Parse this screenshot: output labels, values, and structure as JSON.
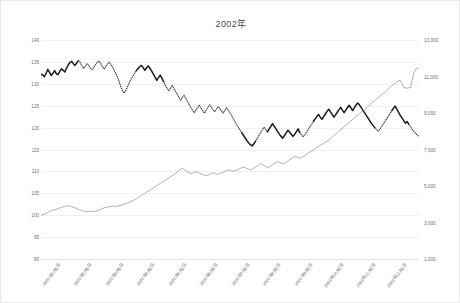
{
  "chart_data": {
    "type": "line",
    "title": "2002年",
    "xlabel": "",
    "ylabel": "",
    "grid": true,
    "legend": "none",
    "left_axis": {
      "ticks": [
        "140",
        "135",
        "130",
        "125",
        "120",
        "115",
        "110",
        "105",
        "100",
        "95",
        "90"
      ],
      "min": 90,
      "max": 140,
      "step": 5
    },
    "right_axis": {
      "ticks": [
        "13,000",
        "11,000",
        "9,000",
        "7,000",
        "5,000",
        "3,000",
        "1,000"
      ],
      "min": 1000,
      "max": 13000,
      "step": 2000
    },
    "x_ticks": [
      "2002年1月1日",
      "2002年2月1日",
      "2002年3月1日",
      "2002年4月1日",
      "2002年5月1日",
      "2002年6月1日",
      "2002年7月1日",
      "2002年8月1日",
      "2002年9月1日",
      "2002年10月1日",
      "2002年11月1日",
      "2002年12月1日"
    ],
    "series": [
      {
        "name": "upper-rate-series",
        "axis": "left",
        "color": "#1a1a1a",
        "style": "mixed-solid-dotted",
        "values": [
          132.2,
          132.0,
          131.6,
          132.4,
          133.3,
          132.6,
          131.9,
          132.4,
          133.0,
          132.3,
          132.1,
          132.8,
          133.4,
          133.1,
          132.7,
          133.6,
          134.3,
          134.9,
          135.1,
          134.6,
          134.2,
          134.8,
          135.3,
          134.9,
          134.1,
          133.5,
          134.0,
          134.6,
          134.2,
          133.6,
          133.2,
          133.8,
          134.4,
          134.9,
          135.2,
          134.7,
          134.0,
          133.4,
          133.9,
          134.5,
          135.0,
          134.4,
          133.8,
          133.1,
          132.3,
          131.5,
          130.4,
          129.2,
          128.3,
          127.9,
          128.6,
          129.5,
          130.4,
          131.1,
          131.8,
          132.4,
          133.0,
          133.5,
          133.9,
          134.2,
          133.7,
          133.1,
          133.6,
          134.1,
          133.5,
          132.9,
          132.2,
          131.5,
          130.8,
          131.4,
          132.0,
          131.3,
          130.5,
          129.7,
          129.0,
          128.4,
          129.0,
          129.6,
          129.0,
          128.3,
          127.6,
          126.9,
          126.2,
          126.8,
          127.4,
          126.7,
          126.0,
          125.3,
          124.6,
          124.0,
          123.4,
          124.0,
          124.6,
          125.1,
          124.5,
          123.9,
          123.3,
          124.0,
          124.6,
          125.2,
          124.7,
          124.1,
          123.6,
          124.2,
          124.8,
          124.3,
          123.8,
          123.3,
          124.0,
          124.5,
          124.0,
          123.4,
          122.7,
          122.0,
          121.3,
          120.6,
          120.0,
          119.4,
          118.8,
          118.2,
          117.6,
          117.0,
          116.5,
          116.1,
          115.8,
          116.3,
          116.9,
          117.5,
          118.2,
          118.9,
          119.5,
          120.1,
          119.6,
          119.0,
          119.7,
          120.3,
          120.9,
          120.3,
          119.7,
          119.1,
          118.5,
          118.0,
          117.6,
          118.2,
          118.8,
          119.4,
          119.0,
          118.5,
          118.0,
          118.5,
          119.1,
          119.7,
          118.9,
          118.3,
          117.9,
          118.4,
          119.0,
          119.6,
          120.2,
          120.8,
          121.4,
          122.0,
          122.5,
          123.0,
          122.4,
          121.9,
          122.5,
          123.1,
          123.7,
          124.2,
          123.6,
          123.0,
          122.4,
          122.9,
          123.5,
          124.1,
          124.6,
          124.0,
          123.4,
          124.0,
          124.6,
          125.1,
          124.5,
          123.9,
          124.5,
          125.1,
          125.6,
          125.2,
          124.6,
          124.0,
          123.4,
          122.8,
          122.2,
          121.6,
          121.0,
          120.5,
          120.0,
          119.5,
          119.2,
          119.6,
          120.2,
          120.8,
          121.4,
          122.0,
          122.6,
          123.2,
          123.8,
          124.4,
          124.9,
          124.2,
          123.5,
          122.8,
          122.2,
          121.6,
          121.0,
          121.4,
          120.8,
          120.2,
          119.6,
          119.1,
          118.7,
          118.3,
          118.0
        ]
      },
      {
        "name": "lower-count-series",
        "axis": "right",
        "color": "#8c8c8c",
        "style": "solid-thin",
        "values": [
          3400,
          3420,
          3450,
          3500,
          3560,
          3600,
          3640,
          3680,
          3700,
          3720,
          3760,
          3800,
          3830,
          3860,
          3880,
          3900,
          3920,
          3900,
          3870,
          3840,
          3800,
          3760,
          3720,
          3680,
          3650,
          3620,
          3600,
          3590,
          3600,
          3620,
          3610,
          3600,
          3620,
          3650,
          3680,
          3720,
          3760,
          3800,
          3820,
          3840,
          3860,
          3880,
          3900,
          3890,
          3880,
          3900,
          3920,
          3950,
          3980,
          4000,
          4040,
          4080,
          4120,
          4160,
          4200,
          4250,
          4300,
          4360,
          4420,
          4480,
          4540,
          4600,
          4660,
          4720,
          4780,
          4840,
          4900,
          4960,
          5020,
          5080,
          5140,
          5200,
          5260,
          5320,
          5380,
          5440,
          5500,
          5560,
          5620,
          5700,
          5780,
          5860,
          5920,
          5960,
          5900,
          5840,
          5780,
          5720,
          5680,
          5700,
          5740,
          5780,
          5760,
          5720,
          5680,
          5640,
          5600,
          5560,
          5600,
          5640,
          5680,
          5720,
          5700,
          5660,
          5640,
          5680,
          5720,
          5760,
          5800,
          5840,
          5880,
          5860,
          5820,
          5800,
          5840,
          5880,
          5920,
          5960,
          6000,
          6040,
          6000,
          5960,
          5920,
          5880,
          5920,
          5980,
          6040,
          6100,
          6160,
          6220,
          6180,
          6120,
          6060,
          6000,
          6040,
          6100,
          6160,
          6220,
          6280,
          6340,
          6300,
          6260,
          6220,
          6260,
          6320,
          6380,
          6440,
          6500,
          6560,
          6620,
          6600,
          6560,
          6520,
          6560,
          6620,
          6680,
          6740,
          6800,
          6860,
          6920,
          6980,
          7040,
          7100,
          7160,
          7220,
          7280,
          7340,
          7400,
          7460,
          7520,
          7600,
          7680,
          7760,
          7840,
          7920,
          8000,
          8080,
          8160,
          8240,
          8320,
          8400,
          8480,
          8560,
          8640,
          8720,
          8800,
          8880,
          8960,
          9040,
          9120,
          9200,
          9280,
          9360,
          9440,
          9520,
          9600,
          9680,
          9760,
          9840,
          9920,
          10000,
          10080,
          10160,
          10240,
          10320,
          10400,
          10480,
          10560,
          10640,
          10700,
          10760,
          10800,
          10600,
          10400,
          10380,
          10360,
          10380,
          10400,
          10800,
          11200,
          11400,
          11450,
          11480
        ]
      }
    ]
  }
}
